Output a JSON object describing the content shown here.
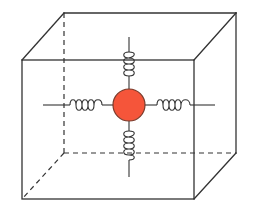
{
  "diagram": {
    "title": "",
    "colors": {
      "background": "#ffffff",
      "line": "#333333",
      "ball_fill": "#F5553A",
      "ball_stroke": "#7a3a2a"
    },
    "cube": {
      "front": {
        "x1": 22,
        "y1": 60,
        "x2": 194,
        "y2": 199
      },
      "back": {
        "x1": 64,
        "y1": 13,
        "x2": 236,
        "y2": 153
      },
      "hidden_edges": [
        "back-left-vertical",
        "back-bottom-horizontal",
        "bottom-left-diagonal"
      ]
    },
    "ball": {
      "cx": 129,
      "cy": 105,
      "r": 16
    },
    "springs": [
      {
        "id": "top",
        "direction": "vertical",
        "coils": 4
      },
      {
        "id": "bottom",
        "direction": "vertical",
        "coils": 4
      },
      {
        "id": "left",
        "direction": "horizontal",
        "coils": 4
      },
      {
        "id": "right",
        "direction": "horizontal",
        "coils": 4
      }
    ],
    "labels": []
  }
}
